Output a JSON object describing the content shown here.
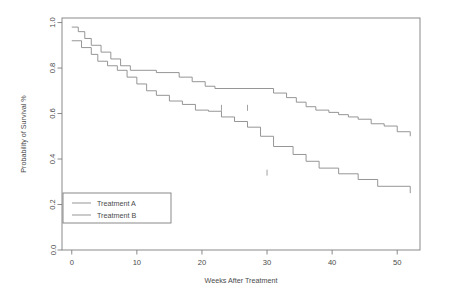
{
  "chart_data": {
    "type": "line",
    "subtype": "kaplan-meier-step",
    "title": "",
    "xlabel": "Weeks After Treatment",
    "ylabel": "Probability of Survival %",
    "xlim": [
      -1.5,
      53.5
    ],
    "ylim": [
      0.0,
      1.02
    ],
    "xticks": [
      0,
      10,
      20,
      30,
      40,
      50
    ],
    "xticklabels": [
      "0",
      "10",
      "20",
      "30",
      "40",
      "50"
    ],
    "yticks": [
      0.0,
      0.2,
      0.4,
      0.6,
      0.8,
      1.0
    ],
    "yticklabels": [
      "0.0",
      "0.2",
      "0.4",
      "0.6",
      "0.8",
      "1.0"
    ],
    "grid": false,
    "legend_position": "lower-left",
    "line_color": "#8a8a8a",
    "axis_color": "#7d7d7d",
    "text_color": "#4a4a4a",
    "series": [
      {
        "name": "Treatment A",
        "step": "post",
        "x": [
          0,
          1,
          2,
          3,
          4.5,
          6,
          7.5,
          9,
          13,
          16.5,
          18.5,
          20.5,
          22,
          31,
          33,
          34.5,
          36,
          37.5,
          39.5,
          41,
          42.5,
          44,
          46,
          48,
          50,
          52
        ],
        "y": [
          0.98,
          0.96,
          0.93,
          0.9,
          0.87,
          0.84,
          0.81,
          0.79,
          0.78,
          0.76,
          0.74,
          0.72,
          0.71,
          0.69,
          0.67,
          0.65,
          0.63,
          0.615,
          0.605,
          0.595,
          0.585,
          0.575,
          0.555,
          0.545,
          0.52,
          0.5
        ],
        "censor_x": [
          23,
          27
        ],
        "censor_y": [
          0.625,
          0.625
        ],
        "final_value": 0.375
      },
      {
        "name": "Treatment B",
        "step": "post",
        "x": [
          0,
          1.5,
          3,
          4,
          5.5,
          7,
          8.5,
          10,
          11.5,
          13,
          15,
          17,
          19,
          21,
          23,
          25,
          27,
          29,
          31,
          34,
          36,
          38,
          41,
          44,
          47,
          52
        ],
        "y": [
          0.92,
          0.89,
          0.86,
          0.83,
          0.81,
          0.79,
          0.76,
          0.73,
          0.7,
          0.68,
          0.655,
          0.64,
          0.615,
          0.61,
          0.585,
          0.565,
          0.54,
          0.5,
          0.455,
          0.42,
          0.39,
          0.36,
          0.335,
          0.31,
          0.28,
          0.25
        ],
        "censor_x": [
          30
        ],
        "censor_y": [
          0.34
        ],
        "final_value": 0.16
      }
    ],
    "legend_entries": [
      "Treatment A",
      "Treatment B"
    ]
  },
  "axes": {
    "xlabel": "Weeks After Treatment",
    "ylabel": "Probability of Survival %"
  },
  "legend": {
    "items": [
      {
        "label": "Treatment A"
      },
      {
        "label": "Treatment B"
      }
    ]
  }
}
